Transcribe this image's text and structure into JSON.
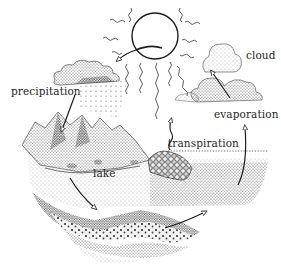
{
  "diagram": {
    "labels": {
      "cloud": "cloud",
      "precipitation": "precipitation",
      "evaporation": "evaporation",
      "transpiration": "transpiration",
      "lake": "lake"
    },
    "elements": [
      "sun",
      "clouds",
      "rain",
      "mountains",
      "lake",
      "forest",
      "sea",
      "groundwater-layers",
      "arrows"
    ],
    "colors": {
      "ink": "#1e1e1e",
      "background": "#ffffff",
      "stipple": "#555555"
    }
  }
}
